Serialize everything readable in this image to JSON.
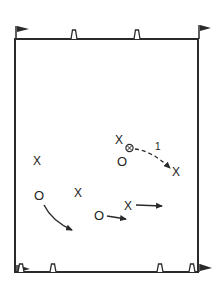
{
  "diagram": {
    "type": "soccer-drill-field",
    "colors": {
      "ink": "#2a2a2a",
      "background": "#ffffff"
    },
    "field": {
      "x": 15,
      "y": 39,
      "width": 183,
      "height": 233
    },
    "flags": [
      {
        "name": "top-left-flag",
        "x": 15,
        "y": 39
      },
      {
        "name": "top-right-flag",
        "x": 198,
        "y": 39
      },
      {
        "name": "bottom-left-flag",
        "x": 15,
        "y": 272
      },
      {
        "name": "bottom-right-flag",
        "x": 198,
        "y": 272
      }
    ],
    "cones": [
      {
        "x": 74,
        "y": 39
      },
      {
        "x": 137,
        "y": 39
      },
      {
        "x": 20,
        "y": 272
      },
      {
        "x": 53,
        "y": 272
      },
      {
        "x": 160,
        "y": 272
      },
      {
        "x": 192,
        "y": 272
      }
    ],
    "players": {
      "attackers_label": "X",
      "defenders_label": "O",
      "attackers": [
        {
          "x": 37,
          "y": 161
        },
        {
          "x": 78,
          "y": 193
        },
        {
          "x": 120,
          "y": 140
        },
        {
          "x": 176,
          "y": 172
        },
        {
          "x": 128,
          "y": 206
        }
      ],
      "defenders": [
        {
          "x": 39,
          "y": 196
        },
        {
          "x": 122,
          "y": 161
        },
        {
          "x": 99,
          "y": 215
        }
      ]
    },
    "ball": {
      "x": 129,
      "y": 148
    },
    "pass": {
      "label": "1",
      "style": "dashed"
    }
  }
}
